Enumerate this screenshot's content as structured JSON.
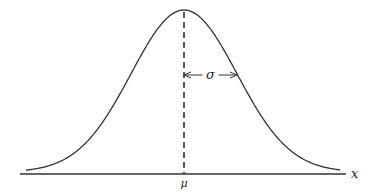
{
  "diagram": {
    "labels": {
      "mean": "μ",
      "sigma": "σ",
      "x_axis": "x"
    },
    "geometry": {
      "axis_y": 174,
      "axis_x_start": 20,
      "axis_x_end": 346,
      "curve_x_start": 26,
      "curve_x_end": 340,
      "mean_x": 184,
      "peak_y": 10,
      "baseline_y": 174,
      "sigma_px": 53,
      "sigma_arrow_y": 75
    },
    "colors": {
      "stroke": "#333333"
    }
  }
}
